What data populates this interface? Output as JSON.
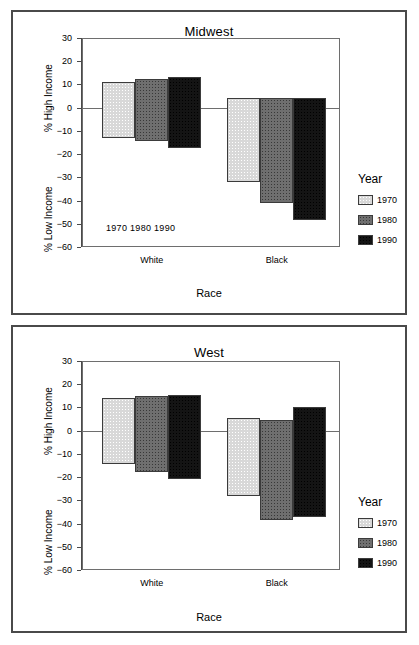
{
  "figure": {
    "axis_title_x": "Race",
    "axis_title_high": "% High Income",
    "axis_title_low": "% Low Income",
    "legend_title": "Year",
    "categories": [
      "White",
      "Black"
    ],
    "inline_year_labels": "1970  1980  1990",
    "yticks": [
      "30",
      "20",
      "10",
      "0",
      "-10",
      "-20",
      "-30",
      "-40",
      "-50",
      "-60"
    ],
    "series_names": [
      "1970",
      "1980",
      "1990"
    ],
    "colors": {
      "y1970": "#d8d8d8",
      "y1980": "#6f6f6f",
      "y1990": "#141414",
      "frame": "#4a4a4a",
      "axis": "#6e6e6e"
    }
  },
  "chart_data": [
    {
      "type": "bar",
      "title": "Midwest",
      "xlabel": "Race",
      "ylabel": "% High Income / % Low Income",
      "ylim": [
        -60,
        30
      ],
      "ytick_values": [
        30,
        20,
        10,
        0,
        -10,
        -20,
        -30,
        -40,
        -50,
        -60
      ],
      "grid": false,
      "legend_position": "right",
      "legend_title": "Year",
      "categories": [
        "White",
        "Black"
      ],
      "series": [
        {
          "name": "1970",
          "high_income": [
            11.0,
            4.0
          ],
          "low_income": [
            -13.0,
            -32.0
          ]
        },
        {
          "name": "1980",
          "high_income": [
            12.5,
            4.0
          ],
          "low_income": [
            -14.5,
            -41.0
          ]
        },
        {
          "name": "1990",
          "high_income": [
            13.0,
            4.0
          ],
          "low_income": [
            -17.5,
            -48.5
          ]
        }
      ]
    },
    {
      "type": "bar",
      "title": "West",
      "xlabel": "Race",
      "ylabel": "% High Income / % Low Income",
      "ylim": [
        -60,
        30
      ],
      "ytick_values": [
        30,
        20,
        10,
        0,
        -10,
        -20,
        -30,
        -40,
        -50,
        -60
      ],
      "grid": false,
      "legend_position": "right",
      "legend_title": "Year",
      "categories": [
        "White",
        "Black"
      ],
      "series": [
        {
          "name": "1970",
          "high_income": [
            14.0,
            5.5
          ],
          "low_income": [
            -14.5,
            -28.0
          ]
        },
        {
          "name": "1980",
          "high_income": [
            15.0,
            4.5
          ],
          "low_income": [
            -18.0,
            -38.5
          ]
        },
        {
          "name": "1990",
          "high_income": [
            15.5,
            10.0
          ],
          "low_income": [
            -21.0,
            -37.0
          ]
        }
      ]
    }
  ]
}
